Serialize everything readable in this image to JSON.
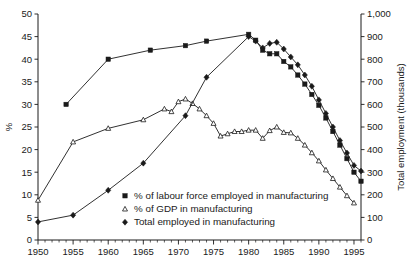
{
  "chart_data": {
    "type": "line",
    "title": "",
    "xlabel": "",
    "ylabel": "%",
    "y2label": "Total employment (thousands)",
    "grid": false,
    "legend_position": "inside-bottom-center",
    "xlim": [
      1950,
      1996
    ],
    "ylim": [
      0,
      50
    ],
    "y2lim": [
      0,
      1000
    ],
    "xticks": [
      1950,
      1955,
      1960,
      1965,
      1970,
      1975,
      1980,
      1985,
      1990,
      1995
    ],
    "xtick_labels": [
      "1950",
      "1955",
      "1960",
      "1965",
      "1970",
      "1975",
      "1980",
      "1985",
      "1990",
      "1995"
    ],
    "xminor_step": 1,
    "yticks": [
      0,
      5,
      10,
      15,
      20,
      25,
      30,
      35,
      40,
      45,
      50
    ],
    "ytick_labels": [
      "0",
      "5",
      "10",
      "15",
      "20",
      "25",
      "30",
      "35",
      "40",
      "45",
      "50"
    ],
    "y2ticks": [
      0,
      100,
      200,
      300,
      400,
      500,
      600,
      700,
      800,
      900,
      1000
    ],
    "y2tick_labels": [
      "0",
      "100",
      "200",
      "300",
      "400",
      "500",
      "600",
      "700",
      "800",
      "900",
      "1,000"
    ],
    "series": [
      {
        "name": "% of labour force employed in manufacturing",
        "marker": "square",
        "axis": "left",
        "x": [
          1954,
          1960,
          1966,
          1971,
          1974,
          1980,
          1981,
          1982,
          1983,
          1984,
          1985,
          1986,
          1987,
          1988,
          1989,
          1990,
          1991,
          1992,
          1993,
          1994,
          1995,
          1996
        ],
        "values": [
          30.0,
          40.0,
          42.0,
          43.0,
          44.0,
          45.5,
          44.2,
          42.0,
          41.2,
          41.2,
          39.5,
          38.3,
          36.5,
          34.5,
          32.2,
          29.8,
          27.0,
          24.0,
          21.0,
          18.0,
          15.0,
          13.0
        ]
      },
      {
        "name": "% of GDP in manufacturing",
        "marker": "triangle",
        "axis": "left",
        "x": [
          1950,
          1955,
          1960,
          1965,
          1968,
          1969,
          1970,
          1971,
          1972,
          1973,
          1974,
          1975,
          1976,
          1977,
          1978,
          1979,
          1980,
          1981,
          1982,
          1983,
          1984,
          1985,
          1986,
          1987,
          1988,
          1989,
          1990,
          1991,
          1992,
          1993,
          1994,
          1995
        ],
        "values": [
          8.8,
          21.7,
          24.7,
          26.6,
          29.0,
          28.4,
          30.6,
          31.2,
          30.2,
          29.0,
          27.5,
          25.8,
          23.0,
          23.5,
          24.0,
          24.0,
          24.3,
          24.3,
          22.5,
          24.2,
          25.0,
          23.8,
          23.7,
          22.5,
          21.0,
          19.3,
          17.5,
          15.5,
          13.6,
          11.7,
          9.8,
          8.2
        ]
      },
      {
        "name": "Total employed in manufacturing",
        "marker": "diamond",
        "axis": "right",
        "x": [
          1950,
          1955,
          1960,
          1965,
          1971,
          1974,
          1980,
          1981,
          1982,
          1983,
          1984,
          1985,
          1986,
          1987,
          1988,
          1989,
          1990,
          1991,
          1992,
          1993,
          1994,
          1995,
          1996
        ],
        "values": [
          80,
          110,
          220,
          340,
          550,
          720,
          900,
          880,
          850,
          870,
          875,
          845,
          810,
          775,
          730,
          680,
          620,
          560,
          500,
          440,
          385,
          330,
          305
        ]
      }
    ],
    "legend": [
      {
        "label": "% of labour force employed in manufacturing",
        "marker": "square"
      },
      {
        "label": "% of GDP in manufacturing",
        "marker": "triangle"
      },
      {
        "label": "Total employed in manufacturing",
        "marker": "diamond"
      }
    ]
  }
}
